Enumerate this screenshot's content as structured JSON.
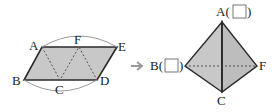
{
  "colors": {
    "fill": "#c8c8c8",
    "fill_dark": "#b4b4b4",
    "edge": "#2a2a2a",
    "fold": "#555555",
    "arc": "#9a9a9a",
    "arrow": "#9a9a9a"
  },
  "net": {
    "labels": {
      "A": "A",
      "B": "B",
      "C": "C",
      "D": "D",
      "E": "E",
      "F": "F"
    }
  },
  "tetrahedron": {
    "labels": {
      "A": "A(",
      "A_close": ")",
      "B": "B(",
      "B_close": ")",
      "C": "C",
      "F": "F"
    },
    "blanks": [
      "A",
      "B"
    ]
  },
  "arrow_icon": "right-arrow-icon"
}
